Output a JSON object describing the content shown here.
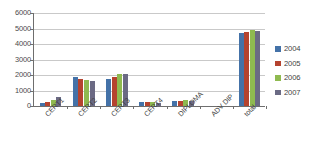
{
  "chart_data": {
    "type": "bar",
    "title": "",
    "subtitle": "",
    "xlabel": "",
    "ylabel": "",
    "ylim": [
      0,
      6000
    ],
    "ytick_values": [
      6000,
      5000,
      4000,
      3000,
      2000,
      1000,
      0
    ],
    "ytick_labels": [
      "6000",
      "5000",
      "4000",
      "3000",
      "2000",
      "1000",
      "0"
    ],
    "grid": true,
    "grid_axis": "y",
    "legend_position": "right",
    "categories": [
      "CERT1",
      "CERT2",
      "CERT3",
      "CERT4",
      "DIPLOMA",
      "ADV DIP",
      "total"
    ],
    "series": [
      {
        "name": "2004",
        "color": "#4472a8",
        "values": [
          220,
          1870,
          1750,
          280,
          330,
          0,
          4700
        ]
      },
      {
        "name": "2005",
        "color": "#b5432f",
        "values": [
          230,
          1720,
          1900,
          260,
          350,
          0,
          4760
        ]
      },
      {
        "name": "2006",
        "color": "#8fba50",
        "values": [
          420,
          1700,
          2060,
          250,
          360,
          0,
          4880
        ]
      },
      {
        "name": "2007",
        "color": "#6b6a84",
        "values": [
          610,
          1590,
          2080,
          190,
          300,
          0,
          4860
        ]
      }
    ]
  },
  "legend": {
    "items": [
      {
        "label": "2004",
        "color": "#4472a8"
      },
      {
        "label": "2005",
        "color": "#b5432f"
      },
      {
        "label": "2006",
        "color": "#8fba50"
      },
      {
        "label": "2007",
        "color": "#6b6a84"
      }
    ]
  },
  "axis": {
    "y_labels": [
      "6000",
      "5000",
      "4000",
      "3000",
      "2000",
      "1000",
      "0"
    ],
    "x_labels": [
      "CERT1",
      "CERT2",
      "CERT3",
      "CERT4",
      "DIPLOMA",
      "ADV DIP",
      "total"
    ]
  }
}
